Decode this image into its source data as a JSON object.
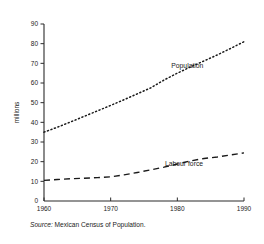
{
  "chart_data": {
    "type": "line",
    "title": "",
    "xlabel": "",
    "ylabel": "millions",
    "xlim": [
      1960,
      1990
    ],
    "ylim": [
      0,
      90
    ],
    "grid": false,
    "legend_position": "inline-annotations",
    "x_ticks": [
      "1960",
      "1970",
      "1980",
      "1990"
    ],
    "x_tick_values": [
      1960,
      1970,
      1980,
      1990
    ],
    "y_ticks": [
      "0",
      "10",
      "20",
      "30",
      "40",
      "50",
      "60",
      "70",
      "80",
      "90"
    ],
    "y_tick_values": [
      0,
      10,
      20,
      30,
      40,
      50,
      60,
      70,
      80,
      90
    ],
    "x": [
      1960,
      1962,
      1964,
      1966,
      1968,
      1970,
      1972,
      1974,
      1976,
      1978,
      1980,
      1982,
      1984,
      1986,
      1988,
      1990
    ],
    "series": [
      {
        "name": "Population",
        "style": "dotted",
        "label": "Population",
        "values": [
          35,
          37.5,
          40.2,
          43,
          45.8,
          48.6,
          51.5,
          54.5,
          57.5,
          61.5,
          65,
          68.2,
          71.2,
          74.3,
          77.6,
          81
        ]
      },
      {
        "name": "Labour force",
        "style": "dashed",
        "label": "Labour force",
        "values": [
          10.5,
          10.9,
          11.3,
          11.6,
          11.9,
          12.3,
          13.3,
          14.5,
          15.8,
          17.2,
          18.8,
          20.4,
          21.6,
          22.4,
          23.4,
          24.5
        ]
      }
    ],
    "annotations": [
      {
        "text": "Population",
        "x": 1981.5,
        "y": 67.5
      },
      {
        "text": "Labour force",
        "x": 1981.0,
        "y": 18.0
      }
    ]
  },
  "source": {
    "label": "Source:",
    "text": "Mexican Census of Population."
  },
  "colors": {
    "axis": "#2b2b2b",
    "series": "#1a1a1a",
    "background": "#ffffff"
  }
}
